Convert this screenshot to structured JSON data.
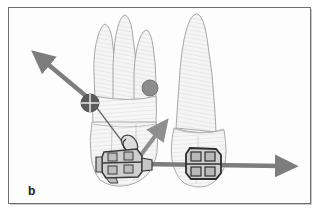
{
  "figure": {
    "panel_label": "b",
    "caption_text": "",
    "background_color": "#ffffff",
    "border_color": "#6d6f72"
  },
  "colors": {
    "tooth_fill": "#f2f2f2",
    "tooth_outline": "#9a9a9a",
    "tooth_hatch": "#d9d9d9",
    "arrow_gray": "#7d7d7d",
    "arrow_dark": "#6a6a6a",
    "marker_dark": "#555555",
    "marker_gray": "#8c8c8c",
    "bracket_fill": "#d0d0d0",
    "bracket_outline": "#3a3a3a",
    "wire_gray": "#8a8a8a",
    "label_color": "#1a1a1a"
  },
  "elements": {
    "left_tooth": {
      "name": "multi-rooted molar",
      "root_count": 3,
      "position": "left"
    },
    "right_tooth": {
      "name": "single-rooted canine",
      "root_count": 1,
      "position": "right"
    },
    "center_of_resistance_marker": {
      "style": "crosshair-circle",
      "color": "#555555"
    },
    "center_of_rotation_marker": {
      "style": "solid-circle",
      "color": "#8c8c8c"
    },
    "left_bracket": {
      "name": "orthodontic bracket with hook and ligature",
      "tooth": "left"
    },
    "right_bracket": {
      "name": "orthodontic bracket twin",
      "tooth": "right"
    },
    "archwire": {
      "name": "archwire spanning both brackets"
    }
  },
  "vectors": [
    {
      "id": "force-resultant-upleft",
      "label": "",
      "direction": "up-left",
      "from": [
        92,
        101
      ],
      "to": [
        40,
        57
      ],
      "color": "#7d7d7d"
    },
    {
      "id": "force-bracket-upright",
      "label": "",
      "direction": "up-right",
      "from": [
        132,
        162
      ],
      "to": [
        160,
        128
      ],
      "color": "#8c8c8c"
    },
    {
      "id": "force-horizontal-right",
      "label": "",
      "direction": "right",
      "from": [
        140,
        163
      ],
      "to": [
        288,
        163
      ],
      "color": "#7d7d7d"
    },
    {
      "id": "line-of-action-thin",
      "label": "",
      "direction": "down-right",
      "from": [
        92,
        101
      ],
      "to": [
        128,
        150
      ],
      "color": "#6a6a6a"
    }
  ]
}
